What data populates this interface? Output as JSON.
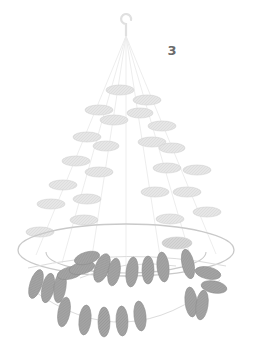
{
  "figure": {
    "label": "3",
    "caption_text": "3",
    "background_color": "#ffffff"
  },
  "palette": {
    "thread": "#dcdcdc",
    "thread_faint": "#ebebeb",
    "hoop": "#c9c9c9",
    "bead_light": "#e3e3e3",
    "bead_light_stroke": "#d2d2d2",
    "bead_mid": "#cfcfcf",
    "bead_dark": "#9e9e9e",
    "bead_dark_stroke": "#8e8e8e",
    "label_color": "#6b6b6b",
    "hook": "#e0e0e0"
  },
  "drawing": {
    "title": "Hanging beaded mobile",
    "hook": {
      "cx": 126,
      "cy": 22,
      "r": 5
    },
    "apex": {
      "x": 126,
      "y": 36
    },
    "hoop": {
      "cx": 126,
      "cy": 250,
      "rx": 108,
      "ry": 26
    },
    "inner_rim": {
      "cx": 126,
      "cy": 252,
      "rx": 80,
      "ry": 21
    },
    "strands": [
      {
        "name": "strand-1",
        "x2": 36,
        "y2": 255
      },
      {
        "name": "strand-2",
        "x2": 62,
        "y2": 263
      },
      {
        "name": "strand-3",
        "x2": 90,
        "y2": 269
      },
      {
        "name": "strand-4",
        "x2": 126,
        "y2": 272
      },
      {
        "name": "strand-5",
        "x2": 162,
        "y2": 269
      },
      {
        "name": "strand-6",
        "x2": 192,
        "y2": 262
      },
      {
        "name": "strand-7",
        "x2": 216,
        "y2": 254
      }
    ],
    "upper_beads": [
      {
        "cx": 120,
        "cy": 90,
        "rx": 14,
        "ry": 5,
        "tone": "light"
      },
      {
        "cx": 147,
        "cy": 100,
        "rx": 14,
        "ry": 5,
        "tone": "light"
      },
      {
        "cx": 99,
        "cy": 110,
        "rx": 14,
        "ry": 5,
        "tone": "light"
      },
      {
        "cx": 140,
        "cy": 113,
        "rx": 13,
        "ry": 5,
        "tone": "light"
      },
      {
        "cx": 114,
        "cy": 120,
        "rx": 14,
        "ry": 5,
        "tone": "light"
      },
      {
        "cx": 162,
        "cy": 126,
        "rx": 14,
        "ry": 5,
        "tone": "light"
      },
      {
        "cx": 87,
        "cy": 137,
        "rx": 14,
        "ry": 5,
        "tone": "light"
      },
      {
        "cx": 152,
        "cy": 142,
        "rx": 14,
        "ry": 5,
        "tone": "light"
      },
      {
        "cx": 106,
        "cy": 146,
        "rx": 13,
        "ry": 5,
        "tone": "light"
      },
      {
        "cx": 172,
        "cy": 148,
        "rx": 13,
        "ry": 5,
        "tone": "light"
      },
      {
        "cx": 76,
        "cy": 161,
        "rx": 14,
        "ry": 5,
        "tone": "light"
      },
      {
        "cx": 99,
        "cy": 172,
        "rx": 14,
        "ry": 5,
        "tone": "light"
      },
      {
        "cx": 167,
        "cy": 168,
        "rx": 14,
        "ry": 5,
        "tone": "light"
      },
      {
        "cx": 197,
        "cy": 170,
        "rx": 14,
        "ry": 5,
        "tone": "light"
      },
      {
        "cx": 63,
        "cy": 185,
        "rx": 14,
        "ry": 5,
        "tone": "light"
      },
      {
        "cx": 155,
        "cy": 192,
        "rx": 14,
        "ry": 5,
        "tone": "light"
      },
      {
        "cx": 187,
        "cy": 192,
        "rx": 14,
        "ry": 5,
        "tone": "light"
      },
      {
        "cx": 51,
        "cy": 204,
        "rx": 14,
        "ry": 5,
        "tone": "light"
      },
      {
        "cx": 87,
        "cy": 199,
        "rx": 14,
        "ry": 5,
        "tone": "light"
      },
      {
        "cx": 207,
        "cy": 212,
        "rx": 14,
        "ry": 5,
        "tone": "light"
      },
      {
        "cx": 84,
        "cy": 220,
        "rx": 14,
        "ry": 5,
        "tone": "light"
      },
      {
        "cx": 170,
        "cy": 219,
        "rx": 14,
        "ry": 5,
        "tone": "light"
      },
      {
        "cx": 40,
        "cy": 232,
        "rx": 14,
        "ry": 5,
        "tone": "light"
      },
      {
        "cx": 177,
        "cy": 243,
        "rx": 15,
        "ry": 6,
        "tone": "mid"
      }
    ],
    "upper_swag": {
      "name": "upper-bead-swag",
      "path": "M 80 278 Q 126 258 176 266"
    },
    "lower_swag": {
      "name": "lower-bead-swag",
      "path": "M 30 288 Q 126 360 220 280"
    },
    "rim_swag": {
      "name": "rim-bead-swag",
      "path": "M 28 268 Q 126 246 226 266"
    },
    "lower_beads": [
      {
        "cx": 36,
        "cy": 284,
        "rx": 6,
        "ry": 15,
        "rot": 18,
        "tone": "dark"
      },
      {
        "cx": 48,
        "cy": 288,
        "rx": 6,
        "ry": 15,
        "rot": 12,
        "tone": "dark"
      },
      {
        "cx": 60,
        "cy": 287,
        "rx": 6,
        "ry": 16,
        "rot": 8,
        "tone": "dark"
      },
      {
        "cx": 70,
        "cy": 273,
        "rx": 13,
        "ry": 6,
        "rot": -14,
        "tone": "dark"
      },
      {
        "cx": 82,
        "cy": 268,
        "rx": 13,
        "ry": 6,
        "rot": -14,
        "tone": "dark"
      },
      {
        "cx": 87,
        "cy": 258,
        "rx": 13,
        "ry": 6,
        "rot": -16,
        "tone": "dark"
      },
      {
        "cx": 102,
        "cy": 268,
        "rx": 7,
        "ry": 15,
        "rot": 20,
        "tone": "dark"
      },
      {
        "cx": 114,
        "cy": 272,
        "rx": 6,
        "ry": 14,
        "rot": 10,
        "tone": "dark"
      },
      {
        "cx": 132,
        "cy": 272,
        "rx": 6,
        "ry": 15,
        "rot": 6,
        "tone": "dark"
      },
      {
        "cx": 148,
        "cy": 270,
        "rx": 6,
        "ry": 14,
        "rot": 0,
        "tone": "dark"
      },
      {
        "cx": 163,
        "cy": 267,
        "rx": 6,
        "ry": 15,
        "rot": -6,
        "tone": "dark"
      },
      {
        "cx": 188,
        "cy": 264,
        "rx": 6,
        "ry": 15,
        "rot": -12,
        "tone": "dark"
      },
      {
        "cx": 208,
        "cy": 273,
        "rx": 13,
        "ry": 6,
        "rot": 12,
        "tone": "dark"
      },
      {
        "cx": 214,
        "cy": 287,
        "rx": 13,
        "ry": 6,
        "rot": 10,
        "tone": "dark"
      },
      {
        "cx": 191,
        "cy": 302,
        "rx": 6,
        "ry": 15,
        "rot": -6,
        "tone": "dark"
      },
      {
        "cx": 202,
        "cy": 305,
        "rx": 6,
        "ry": 15,
        "rot": 8,
        "tone": "dark"
      },
      {
        "cx": 64,
        "cy": 312,
        "rx": 6,
        "ry": 15,
        "rot": 10,
        "tone": "dark"
      },
      {
        "cx": 85,
        "cy": 320,
        "rx": 6,
        "ry": 15,
        "rot": 6,
        "tone": "dark"
      },
      {
        "cx": 104,
        "cy": 322,
        "rx": 6,
        "ry": 15,
        "rot": 0,
        "tone": "dark"
      },
      {
        "cx": 122,
        "cy": 321,
        "rx": 6,
        "ry": 15,
        "rot": -2,
        "tone": "dark"
      },
      {
        "cx": 140,
        "cy": 316,
        "rx": 6,
        "ry": 15,
        "rot": -6,
        "tone": "dark"
      }
    ]
  }
}
